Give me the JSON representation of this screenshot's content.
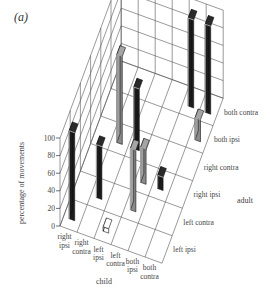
{
  "panel_label": "(a)",
  "chart_data": {
    "type": "bar3d",
    "title": "",
    "zlabel": "percentage of movements",
    "zlim": [
      0,
      100
    ],
    "zticks": [
      0,
      20,
      40,
      60,
      80,
      100
    ],
    "child_axis": {
      "title": "child",
      "categories": [
        "right ipsi",
        "right contra",
        "left ipsi",
        "left contra",
        "both ipsi",
        "both contra"
      ]
    },
    "adult_axis": {
      "title": "adult",
      "categories": [
        "left ipsi",
        "left contra",
        "right ipsi",
        "right contra",
        "both ipsi",
        "both contra"
      ]
    },
    "bars": [
      {
        "child": "right ipsi",
        "adult": "left ipsi",
        "value": 100,
        "style": "black"
      },
      {
        "child": "right contra",
        "adult": "left contra",
        "value": 60,
        "style": "black"
      },
      {
        "child": "left ipsi",
        "adult": "left ipsi",
        "value": 5,
        "style": "white"
      },
      {
        "child": "left contra",
        "adult": "left contra",
        "value": 70,
        "style": "gray"
      },
      {
        "child": "left contra",
        "adult": "right ipsi",
        "value": 40,
        "style": "gray"
      },
      {
        "child": "right contra",
        "adult": "right contra",
        "value": 100,
        "style": "gray"
      },
      {
        "child": "left ipsi",
        "adult": "right contra",
        "value": 70,
        "style": "black"
      },
      {
        "child": "both ipsi",
        "adult": "right ipsi",
        "value": 15,
        "style": "black"
      },
      {
        "child": "both ipsi",
        "adult": "both contra",
        "value": 100,
        "style": "black"
      },
      {
        "child": "both contra",
        "adult": "both ipsi",
        "value": 25,
        "style": "gray"
      },
      {
        "child": "both contra",
        "adult": "both contra",
        "value": 100,
        "style": "black"
      }
    ],
    "colors": {
      "black": "#1c1c1c",
      "gray": "#8a8a8a",
      "white": "#ffffff",
      "grid": "#555555"
    }
  }
}
